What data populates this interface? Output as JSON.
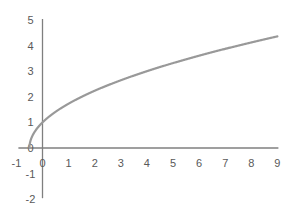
{
  "chart_data": {
    "type": "line",
    "title": "",
    "xlabel": "",
    "ylabel": "",
    "xlim": [
      -1,
      9
    ],
    "ylim": [
      -2,
      5
    ],
    "grid": false,
    "legend": null,
    "x_ticks": [
      -1,
      0,
      1,
      2,
      3,
      4,
      5,
      6,
      7,
      8,
      9
    ],
    "y_ticks": [
      -2,
      -1,
      0,
      1,
      2,
      3,
      4,
      5
    ],
    "x_tick_labels": [
      "-1",
      "0",
      "1",
      "2",
      "3",
      "4",
      "5",
      "6",
      "7",
      "8",
      "9"
    ],
    "y_tick_labels": [
      "-2",
      "-1",
      "0",
      "1",
      "2",
      "3",
      "4",
      "5"
    ],
    "series": [
      {
        "name": "y = sqrt(2x + 1)",
        "color": "#999999",
        "x": [
          -0.5,
          -0.45,
          -0.4,
          -0.3,
          -0.2,
          -0.1,
          0,
          0.25,
          0.5,
          1,
          1.5,
          2,
          2.5,
          3,
          3.5,
          4,
          4.5,
          5,
          5.5,
          6,
          6.5,
          7,
          7.5,
          8,
          8.5,
          9
        ],
        "y": [
          0,
          0.32,
          0.45,
          0.63,
          0.77,
          0.89,
          1,
          1.22,
          1.41,
          1.73,
          2,
          2.24,
          2.45,
          2.65,
          2.83,
          3,
          3.16,
          3.32,
          3.46,
          3.61,
          3.74,
          3.87,
          4,
          4.12,
          4.24,
          4.36
        ]
      }
    ],
    "axis_color": "#7f7f7f"
  }
}
